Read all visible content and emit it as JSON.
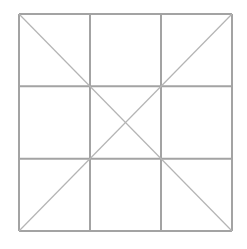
{
  "diagram": {
    "type": "3x3 grid with diagonals",
    "grid": {
      "left": 19,
      "top": 14,
      "right": 232,
      "bottom": 231,
      "cols": 3,
      "rows": 3
    },
    "grid_color": "#a3a3a3",
    "diagonal_color": "#b4b4b4",
    "background": "#ffffff"
  }
}
